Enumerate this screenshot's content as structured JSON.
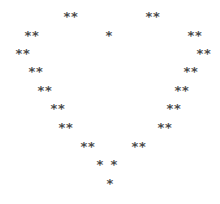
{
  "art": {
    "description": "ASCII heart made of asterisks",
    "color": "#4a4a4a",
    "background": "#ffffff",
    "glyphs": [
      {
        "text": "**",
        "x": 63,
        "y": 10
      },
      {
        "text": "**",
        "x": 145,
        "y": 10
      },
      {
        "text": "**",
        "x": 24,
        "y": 29
      },
      {
        "text": "*",
        "x": 105,
        "y": 29
      },
      {
        "text": "**",
        "x": 187,
        "y": 29
      },
      {
        "text": "**",
        "x": 15,
        "y": 47
      },
      {
        "text": "**",
        "x": 196,
        "y": 47
      },
      {
        "text": "**",
        "x": 28,
        "y": 65
      },
      {
        "text": "**",
        "x": 183,
        "y": 65
      },
      {
        "text": "**",
        "x": 37,
        "y": 84
      },
      {
        "text": "**",
        "x": 174,
        "y": 84
      },
      {
        "text": "**",
        "x": 50,
        "y": 102
      },
      {
        "text": "**",
        "x": 166,
        "y": 102
      },
      {
        "text": "**",
        "x": 58,
        "y": 121
      },
      {
        "text": "**",
        "x": 157,
        "y": 121
      },
      {
        "text": "**",
        "x": 80,
        "y": 140
      },
      {
        "text": "**",
        "x": 131,
        "y": 140
      },
      {
        "text": "*",
        "x": 96,
        "y": 158
      },
      {
        "text": "*",
        "x": 110,
        "y": 158
      },
      {
        "text": "*",
        "x": 106,
        "y": 177
      }
    ]
  }
}
